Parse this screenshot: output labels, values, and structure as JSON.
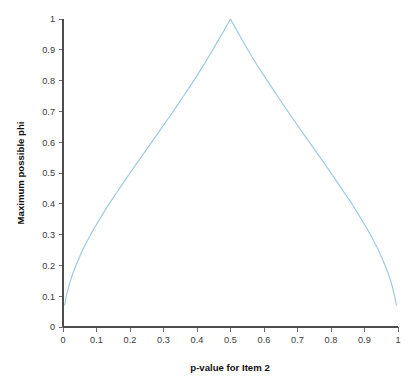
{
  "chart_data": {
    "type": "line",
    "title": "",
    "xlabel": "p-value for Item 2",
    "ylabel": "Maximum possible phi",
    "xlim": [
      0,
      1
    ],
    "ylim": [
      0,
      1
    ],
    "grid": false,
    "legend": null,
    "line_color": "#9ac9e3",
    "xticks": [
      "0",
      "0.1",
      "0.2",
      "0.3",
      "0.4",
      "0.5",
      "0.6",
      "0.7",
      "0.8",
      "0.9",
      "1"
    ],
    "xtick_values": [
      0,
      0.1,
      0.2,
      0.3,
      0.4,
      0.5,
      0.6,
      0.7,
      0.8,
      0.9,
      1
    ],
    "yticks": [
      "0",
      "0.1",
      "0.2",
      "0.3",
      "0.4",
      "0.5",
      "0.6",
      "0.7",
      "0.8",
      "0.9",
      "1"
    ],
    "ytick_values": [
      0,
      0.1,
      0.2,
      0.3,
      0.4,
      0.5,
      0.6,
      0.7,
      0.8,
      0.9,
      1
    ],
    "series": [
      {
        "name": "Maximum possible phi",
        "x": [
          0.005,
          0.01,
          0.02,
          0.03,
          0.04,
          0.05,
          0.06,
          0.07,
          0.08,
          0.09,
          0.1,
          0.12,
          0.14,
          0.16,
          0.18,
          0.2,
          0.22,
          0.24,
          0.26,
          0.28,
          0.3,
          0.32,
          0.34,
          0.36,
          0.38,
          0.4,
          0.42,
          0.44,
          0.46,
          0.48,
          0.5,
          0.52,
          0.54,
          0.56,
          0.58,
          0.6,
          0.62,
          0.64,
          0.66,
          0.68,
          0.7,
          0.72,
          0.74,
          0.76,
          0.78,
          0.8,
          0.82,
          0.84,
          0.86,
          0.88,
          0.9,
          0.91,
          0.92,
          0.93,
          0.94,
          0.95,
          0.96,
          0.97,
          0.98,
          0.99,
          0.995
        ],
        "y": [
          0.071,
          0.101,
          0.143,
          0.176,
          0.204,
          0.229,
          0.253,
          0.274,
          0.295,
          0.315,
          0.333,
          0.369,
          0.404,
          0.436,
          0.468,
          0.5,
          0.531,
          0.562,
          0.593,
          0.624,
          0.655,
          0.686,
          0.718,
          0.75,
          0.783,
          0.816,
          0.851,
          0.887,
          0.924,
          0.961,
          1.0,
          0.96,
          0.922,
          0.885,
          0.849,
          0.816,
          0.783,
          0.75,
          0.718,
          0.686,
          0.655,
          0.624,
          0.593,
          0.562,
          0.531,
          0.5,
          0.468,
          0.436,
          0.404,
          0.369,
          0.333,
          0.315,
          0.295,
          0.274,
          0.253,
          0.229,
          0.204,
          0.176,
          0.143,
          0.101,
          0.071
        ]
      }
    ]
  }
}
